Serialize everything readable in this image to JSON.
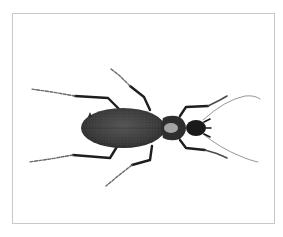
{
  "image": {
    "subject": "ground beetle specimen, dorsal view",
    "background_color": "#ffffff",
    "frame_color": "#c8c8c8",
    "body_color": "#3a3a3a",
    "pronotum_highlight_color": "#b8b8b8",
    "leg_color": "#1e1e1e",
    "tarsus_color": "#6a6a6a"
  }
}
